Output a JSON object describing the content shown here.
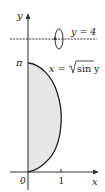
{
  "diagram": {
    "axes": {
      "x_label": "x",
      "y_label": "y",
      "origin_label": "0",
      "x_tick_label": "1",
      "y_tick_label": "π"
    },
    "rotation_axis": {
      "label": "y = 4",
      "style": "dashed"
    },
    "curve": {
      "equation_lhs": "x = ",
      "equation_rhs": "sin y",
      "equation_text": "x = √(sin y)"
    },
    "region": {
      "description": "Region bounded by x = sqrt(sin y) and the y-axis for 0 ≤ y ≤ π, shaded light gray",
      "fill_color": "#e6e6e6"
    },
    "colors": {
      "axis": "#555555",
      "curve": "#222222",
      "text": "#222222"
    }
  }
}
